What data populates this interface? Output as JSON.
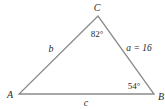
{
  "diagram": {
    "type": "triangle",
    "stroke_color": "#8a8a8a",
    "text_color": "#2a2a2a",
    "vertices": {
      "A": {
        "label": "A",
        "x": 19,
        "y": 94
      },
      "B": {
        "label": "B",
        "x": 154,
        "y": 94
      },
      "C": {
        "label": "C",
        "x": 98,
        "y": 16
      }
    },
    "sides": {
      "a": {
        "label": "a = 16",
        "between": "B-C"
      },
      "b": {
        "label": "b",
        "between": "A-C"
      },
      "c": {
        "label": "c",
        "between": "A-B"
      }
    },
    "angles": {
      "C": {
        "label": "82°"
      },
      "B": {
        "label": "54°"
      }
    }
  }
}
